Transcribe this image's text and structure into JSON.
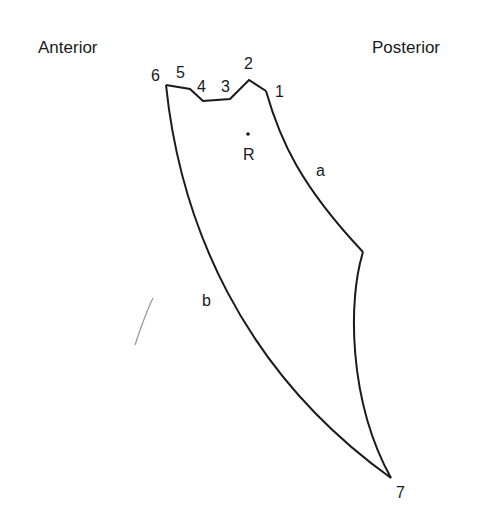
{
  "labels": {
    "anterior": "Anterior",
    "posterior": "Posterior",
    "points": {
      "p1": "1",
      "p2": "2",
      "p3": "3",
      "p4": "4",
      "p5": "5",
      "p6": "6",
      "p7": "7"
    },
    "reference": "R",
    "edge_a": "a",
    "edge_b": "b"
  },
  "colors": {
    "stroke": "#1a1a1a",
    "background": "#ffffff",
    "stray_mark": "#9a9a9a"
  }
}
